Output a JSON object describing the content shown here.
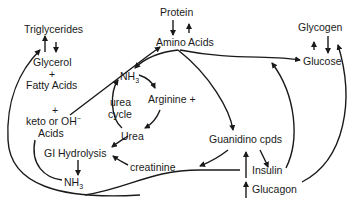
{
  "diagram": {
    "nodes": {
      "protein": "Protein",
      "amino_acids": "Amino Acids",
      "triglycerides": "Triglycerides",
      "glycerol": "Glycerol",
      "plus1": "+",
      "fatty_acids": "Fatty Acids",
      "plus2": "+",
      "keto": "keto or OH",
      "keto_sup": "−",
      "acids": "Acids",
      "nh3_top": "NH",
      "nh3_top_sub": "3",
      "arginine": "Arginine +",
      "urea_cycle_1": "urea",
      "urea_cycle_2": "cycle",
      "urea": "Urea",
      "gi_hydrolysis": "GI Hydrolysis",
      "nh3_bottom": "NH",
      "nh3_bottom_sub": "3",
      "creatinine": "creatinine",
      "guanidino": "Guanidino cpds",
      "glycogen": "Glycogen",
      "glucose": "Glucose",
      "insulin": "Insulin",
      "glucagon": "Glucagon"
    },
    "edges": [
      {
        "from": "Protein",
        "to": "Amino Acids"
      },
      {
        "from": "Amino Acids",
        "to": "Protein"
      },
      {
        "from": "Glycerol + Fatty Acids",
        "to": "Triglycerides"
      },
      {
        "from": "Triglycerides",
        "to": "Glycerol + Fatty Acids"
      },
      {
        "from": "Glycogen",
        "to": "Glucose"
      },
      {
        "from": "Glucose",
        "to": "Glycogen"
      },
      {
        "from": "Amino Acids",
        "to": "Glucose"
      },
      {
        "from": "Amino Acids",
        "to": "NH3"
      },
      {
        "from": "Amino Acids",
        "to": "Guanidino cpds"
      },
      {
        "from": "keto or OH- Acids",
        "to": "Amino Acids"
      },
      {
        "from": "NH3",
        "to": "Arginine"
      },
      {
        "from": "Arginine",
        "to": "Urea"
      },
      {
        "from": "Urea",
        "to": "NH3"
      },
      {
        "from": "Urea",
        "to": "GI Hydrolysis"
      },
      {
        "from": "creatinine",
        "to": "GI Hydrolysis"
      },
      {
        "from": "Guanidino cpds",
        "to": "creatinine"
      },
      {
        "from": "GI Hydrolysis",
        "to": "NH3"
      },
      {
        "from": "Guanidino cpds",
        "to": "Insulin"
      },
      {
        "from": "Insulin",
        "to": "Glucose"
      },
      {
        "from": "Glucagon",
        "to": "Glycogen"
      },
      {
        "from": "Glucagon",
        "to": "Triglycerides"
      }
    ]
  }
}
